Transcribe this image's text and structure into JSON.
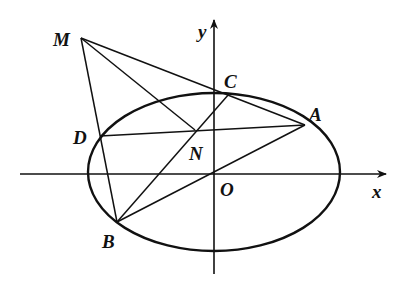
{
  "diagram": {
    "type": "ellipse-geometry",
    "axes": {
      "x_label": "x",
      "y_label": "y",
      "origin_label": "O"
    },
    "ellipse": {
      "cx": 214,
      "cy": 174,
      "rx": 127,
      "ry": 80
    },
    "points": {
      "M": {
        "label": "M",
        "x": 81,
        "y": 38
      },
      "C": {
        "label": "C",
        "x": 229,
        "y": 94
      },
      "A": {
        "label": "A",
        "x": 305,
        "y": 125
      },
      "D": {
        "label": "D",
        "x": 100,
        "y": 136
      },
      "N": {
        "label": "N",
        "x": 195,
        "y": 130
      },
      "O": {
        "label": "O",
        "x": 214,
        "y": 174
      },
      "B": {
        "label": "B",
        "x": 117,
        "y": 222
      }
    },
    "segments": [
      [
        "M",
        "A"
      ],
      [
        "M",
        "B"
      ],
      [
        "M",
        "N"
      ],
      [
        "D",
        "A"
      ],
      [
        "B",
        "C"
      ],
      [
        "B",
        "A"
      ]
    ]
  }
}
